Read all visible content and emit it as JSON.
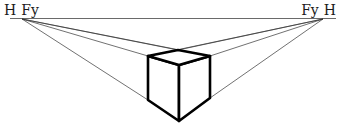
{
  "diagram": {
    "type": "two-point-perspective",
    "labels": {
      "left": {
        "horizon": "H",
        "vanishing_point": "Fy"
      },
      "right": {
        "vanishing_point": "Fy",
        "horizon": "H"
      }
    },
    "colors": {
      "line": "#333333",
      "cube": "#000000",
      "background": "#ffffff"
    },
    "horizon_line": {
      "x1": 10,
      "y1": 18.5,
      "x2": 336,
      "y2": 18.5
    },
    "vanishing_points": {
      "left": {
        "x": 22,
        "y": 19
      },
      "right": {
        "x": 323,
        "y": 19
      }
    },
    "cube": {
      "top_back": {
        "x": 178,
        "y": 50
      },
      "top_left": {
        "x": 148,
        "y": 56
      },
      "top_right": {
        "x": 210,
        "y": 56
      },
      "top_front": {
        "x": 179,
        "y": 65
      },
      "bottom_left": {
        "x": 148,
        "y": 100
      },
      "bottom_right": {
        "x": 210,
        "y": 98
      },
      "bottom_front": {
        "x": 179,
        "y": 121
      }
    }
  }
}
